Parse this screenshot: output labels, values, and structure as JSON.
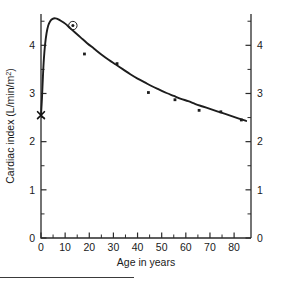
{
  "figure": {
    "name": "cardiac-index-vs-age"
  },
  "chart_data": {
    "type": "line",
    "title": "",
    "xlabel": "Age in years",
    "ylabel": "Cardiac index (L/min/m",
    "ylabel_sup": "2",
    "ylabel_suffix": ")",
    "xlim": [
      0,
      87
    ],
    "ylim": [
      0,
      4.65
    ],
    "grid": false,
    "legend": null,
    "x_ticks": [
      0,
      10,
      20,
      30,
      40,
      50,
      60,
      70,
      80
    ],
    "x_tick_labels": [
      "0",
      "10",
      "20",
      "30",
      "40",
      "50",
      "60",
      "70",
      "80"
    ],
    "x_minor_step": 5,
    "y_ticks": [
      0,
      1,
      2,
      3,
      4
    ],
    "y_tick_labels_left": [
      "0",
      "1",
      "2",
      "3",
      "4"
    ],
    "y_tick_labels_right": [
      "0",
      "1",
      "2",
      "3",
      "4"
    ],
    "y_minor_step": 0.5,
    "right_axis": true,
    "series": [
      {
        "name": "fitted-curve",
        "type": "line",
        "points": [
          [
            0.0,
            2.55
          ],
          [
            0.4,
            2.9
          ],
          [
            0.8,
            3.35
          ],
          [
            1.2,
            3.72
          ],
          [
            1.7,
            4.02
          ],
          [
            2.3,
            4.25
          ],
          [
            3.0,
            4.41
          ],
          [
            3.8,
            4.5
          ],
          [
            4.8,
            4.55
          ],
          [
            6.0,
            4.56
          ],
          [
            7.2,
            4.54
          ],
          [
            8.5,
            4.5
          ],
          [
            10.0,
            4.45
          ],
          [
            12.0,
            4.36
          ],
          [
            14.0,
            4.27
          ],
          [
            16.5,
            4.16
          ],
          [
            19.0,
            4.05
          ],
          [
            22.0,
            3.93
          ],
          [
            25.0,
            3.81
          ],
          [
            28.0,
            3.7
          ],
          [
            31.0,
            3.6
          ],
          [
            34.0,
            3.5
          ],
          [
            37.0,
            3.4
          ],
          [
            40.0,
            3.31
          ],
          [
            43.0,
            3.23
          ],
          [
            46.0,
            3.15
          ],
          [
            49.0,
            3.08
          ],
          [
            52.0,
            3.01
          ],
          [
            55.0,
            2.95
          ],
          [
            58.0,
            2.89
          ],
          [
            61.0,
            2.84
          ],
          [
            64.0,
            2.78
          ],
          [
            67.0,
            2.73
          ],
          [
            70.0,
            2.68
          ],
          [
            73.0,
            2.63
          ],
          [
            76.0,
            2.58
          ],
          [
            79.0,
            2.53
          ],
          [
            82.0,
            2.48
          ],
          [
            85.0,
            2.43
          ]
        ]
      },
      {
        "name": "observed-points",
        "type": "scatter",
        "points": [
          [
            18.0,
            3.82
          ],
          [
            31.5,
            3.62
          ],
          [
            44.5,
            3.02
          ],
          [
            55.5,
            2.87
          ],
          [
            65.5,
            2.65
          ],
          [
            74.5,
            2.62
          ],
          [
            83.0,
            2.45
          ]
        ]
      }
    ],
    "annotations": [
      {
        "name": "highlighted-point",
        "kind": "circled-dot",
        "x": 13.2,
        "y": 4.41
      },
      {
        "name": "origin-x-marker",
        "kind": "x-cross",
        "x": 0.0,
        "y": 2.55
      }
    ]
  }
}
